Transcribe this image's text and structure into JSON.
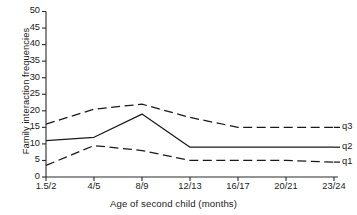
{
  "chart_data": {
    "type": "line",
    "title": "",
    "xlabel": "Age of second child (months)",
    "ylabel": "Family interaction frequencies",
    "categories": [
      "1.5/2",
      "4/5",
      "8/9",
      "12/13",
      "16/17",
      "20/21",
      "23/24"
    ],
    "yticks": [
      0,
      5,
      10,
      15,
      20,
      25,
      30,
      35,
      40,
      45,
      50
    ],
    "ylim": [
      0,
      50
    ],
    "grid": false,
    "legend_position": "right-inline",
    "series": [
      {
        "name": "q3",
        "style": "dashed",
        "color": "#1a1a1a",
        "values": [
          16,
          20.5,
          22,
          18,
          15,
          15,
          15
        ]
      },
      {
        "name": "q2",
        "style": "solid",
        "color": "#1a1a1a",
        "values": [
          11,
          12,
          19,
          9,
          9,
          9,
          9
        ]
      },
      {
        "name": "q1",
        "style": "dashed",
        "color": "#1a1a1a",
        "values": [
          3.5,
          9.5,
          8,
          5,
          5,
          5,
          4.5
        ]
      }
    ]
  },
  "axis": {
    "y_tick_labels": [
      "50",
      "45",
      "40",
      "35",
      "30",
      "25",
      "20",
      "15",
      "10",
      "5",
      "0"
    ],
    "x_tick_labels": [
      "1.5/2",
      "4/5",
      "8/9",
      "12/13",
      "16/17",
      "20/21",
      "23/24"
    ]
  },
  "legend": {
    "items": [
      {
        "label": "q3"
      },
      {
        "label": "q2"
      },
      {
        "label": "q1"
      }
    ]
  }
}
